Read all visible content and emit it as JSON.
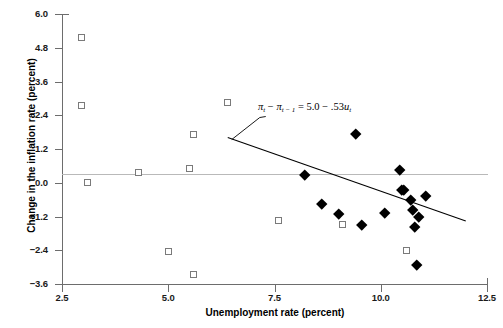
{
  "chart_data": {
    "type": "scatter",
    "title": "",
    "xlabel": "Unemployment rate (percent)",
    "ylabel": "Change in the inflation rate (percent)",
    "xlim": [
      2.5,
      12.5
    ],
    "ylim": [
      -3.6,
      6.0
    ],
    "xticks": [
      "2.5",
      "5.0",
      "7.5",
      "10.0",
      "12.5"
    ],
    "xtick_values": [
      2.5,
      5.0,
      7.5,
      10.0,
      12.5
    ],
    "yticks": [
      "6.0",
      "4.8",
      "3.6",
      "2.4",
      "1.2",
      "0.0",
      "-1.2",
      "-2.4",
      "-3.6"
    ],
    "ytick_values": [
      6.0,
      4.8,
      3.6,
      2.4,
      1.2,
      0.0,
      -1.2,
      -2.4,
      -3.6
    ],
    "grid": false,
    "legend": null,
    "zero_reference_line": 0.0,
    "series": [
      {
        "name": "open-squares",
        "marker": "open-square",
        "color": "#7a7a7a",
        "points": [
          [
            2.95,
            5.15
          ],
          [
            2.95,
            2.75
          ],
          [
            3.1,
            0.0
          ],
          [
            4.3,
            0.35
          ],
          [
            5.5,
            0.5
          ],
          [
            5.6,
            1.7
          ],
          [
            6.4,
            2.85
          ],
          [
            5.0,
            -2.45
          ],
          [
            5.6,
            -3.25
          ],
          [
            7.6,
            -1.35
          ],
          [
            9.1,
            -1.5
          ],
          [
            10.6,
            -2.4
          ]
        ]
      },
      {
        "name": "filled-diamonds",
        "marker": "filled-diamond",
        "color": "#000000",
        "points": [
          [
            8.2,
            0.3
          ],
          [
            8.6,
            -0.75
          ],
          [
            9.4,
            1.75
          ],
          [
            9.0,
            -1.1
          ],
          [
            9.55,
            -1.5
          ],
          [
            10.1,
            -1.05
          ],
          [
            10.45,
            0.45
          ],
          [
            10.5,
            -0.25
          ],
          [
            10.55,
            -0.25
          ],
          [
            10.7,
            -0.6
          ],
          [
            10.75,
            -0.95
          ],
          [
            10.8,
            -1.55
          ],
          [
            10.9,
            -1.2
          ],
          [
            11.05,
            -0.45
          ],
          [
            10.85,
            -2.9
          ]
        ]
      }
    ],
    "trendline": {
      "equation_text": "5.0 - .53u",
      "intercept": 5.0,
      "slope": -0.53,
      "x_start": 6.4,
      "x_end": 12.0,
      "color": "#000000"
    },
    "annotation": {
      "lhs_pi": "π",
      "sub_t": "t",
      "minus": "−",
      "sub_t_minus_1": "t − 1",
      "equals": "=",
      "intercept_text": "5.0",
      "operator": "−",
      "slope_text": ".53",
      "variable": "u",
      "variable_sub": "t"
    }
  },
  "axes": {
    "xlabel": "Unemployment rate (percent)",
    "ylabel": "Change in the inflation rate (percent)"
  }
}
